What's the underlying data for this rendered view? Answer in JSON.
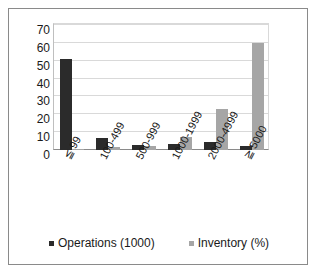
{
  "chart_data": {
    "type": "bar",
    "title": "",
    "xlabel": "",
    "ylabel": "",
    "ylim": [
      0,
      70
    ],
    "yticks": [
      70,
      60,
      50,
      40,
      30,
      20,
      10,
      0
    ],
    "grid": true,
    "legend_position": "bottom",
    "categories": [
      "≦ 99",
      "100-499",
      "500-999",
      "1000-1999",
      "2000-4999",
      "≧ 5000"
    ],
    "series": [
      {
        "name": "Operations (1000)",
        "color": "#2b2b2b",
        "values": [
          51,
          6.5,
          3,
          3.5,
          4.5,
          2.5
        ]
      },
      {
        "name": "Inventory (%)",
        "color": "#a6a6a6",
        "values": [
          0.5,
          1.5,
          2,
          7.5,
          23,
          60
        ]
      }
    ]
  },
  "legend": {
    "items": [
      {
        "label": "Operations (1000)",
        "swatch": "op"
      },
      {
        "label": "Inventory (%)",
        "swatch": "inv"
      }
    ]
  },
  "colors": {
    "operations": "#2b2b2b",
    "inventory": "#a6a6a6",
    "gridline": "#d9d9d9",
    "axis": "#8a8a8a",
    "frame": "#8a8a8a",
    "text": "#1a1a1a",
    "background": "#ffffff"
  }
}
